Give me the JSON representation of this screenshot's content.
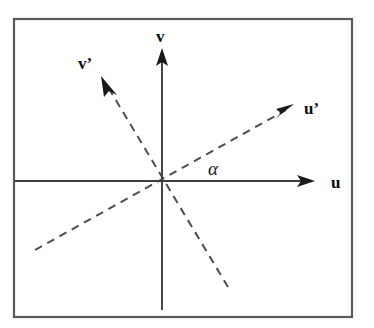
{
  "figure": {
    "background_color": "#ffffff",
    "frame": {
      "x": 14,
      "y": 19,
      "width": 338,
      "height": 298,
      "stroke_color": "#555a5e",
      "stroke_width": 2.2
    },
    "origin": {
      "x": 162,
      "y": 181
    },
    "labels": {
      "u_axis": "u",
      "v_axis": "v",
      "u_prime_axis": "u’",
      "v_prime_axis": "v’",
      "angle": "α"
    },
    "label_positions": {
      "u_axis": {
        "x": 331,
        "y": 188
      },
      "v_axis": {
        "x": 156,
        "y": 42
      },
      "u_prime_axis": {
        "x": 304,
        "y": 114
      },
      "v_prime_axis": {
        "x": 78,
        "y": 69
      },
      "angle": {
        "x": 208,
        "y": 175
      }
    },
    "axes": [
      {
        "name": "u-axis",
        "style": "solid",
        "color": "#3b3f43",
        "x1": 15,
        "y1": 181,
        "x2": 313,
        "y2": 181,
        "arrow_at_end": true
      },
      {
        "name": "v-axis",
        "style": "solid",
        "color": "#3b3f43",
        "x1": 162,
        "y1": 310,
        "x2": 162,
        "y2": 50,
        "arrow_at_end": true
      },
      {
        "name": "u-prime-axis",
        "style": "dashed",
        "color": "#4a4e52",
        "x1": 35,
        "y1": 250,
        "x2": 292,
        "y2": 107,
        "arrow_at_end": true,
        "dash_pattern": "8 6"
      },
      {
        "name": "v-prime-axis",
        "style": "dashed",
        "color": "#4a4e52",
        "x1": 228,
        "y1": 287,
        "x2": 103,
        "y2": 79,
        "arrow_at_end": true,
        "dash_pattern": "8 6"
      }
    ],
    "annotation": {
      "angle_symbol": "α",
      "angle_description": "angle between u axis and u’ axis",
      "angle_degrees": 29
    }
  }
}
